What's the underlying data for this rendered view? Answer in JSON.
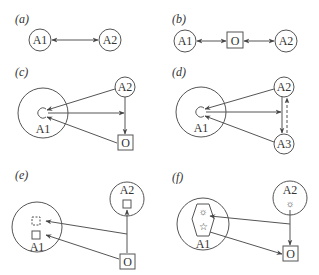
{
  "panels": [
    {
      "id": "a",
      "label": "(a)",
      "nodes": {
        "a1": "A1",
        "a2": "A2"
      }
    },
    {
      "id": "b",
      "label": "(b)",
      "nodes": {
        "a1": "A1",
        "o": "O",
        "a2": "A2"
      }
    },
    {
      "id": "c",
      "label": "(c)",
      "nodes": {
        "a1": "A1",
        "a2": "A2",
        "o": "O"
      }
    },
    {
      "id": "d",
      "label": "(d)",
      "nodes": {
        "a1": "A1",
        "a2": "A2",
        "a3": "A3"
      }
    },
    {
      "id": "e",
      "label": "(e)",
      "nodes": {
        "a1": "A1",
        "a2": "A2",
        "o": "O"
      }
    },
    {
      "id": "f",
      "label": "(f)",
      "nodes": {
        "a1": "A1",
        "a2": "A2",
        "o": "O"
      }
    }
  ],
  "colors": {
    "stroke": "#555555",
    "text": "#333333",
    "background": "#ffffff"
  }
}
